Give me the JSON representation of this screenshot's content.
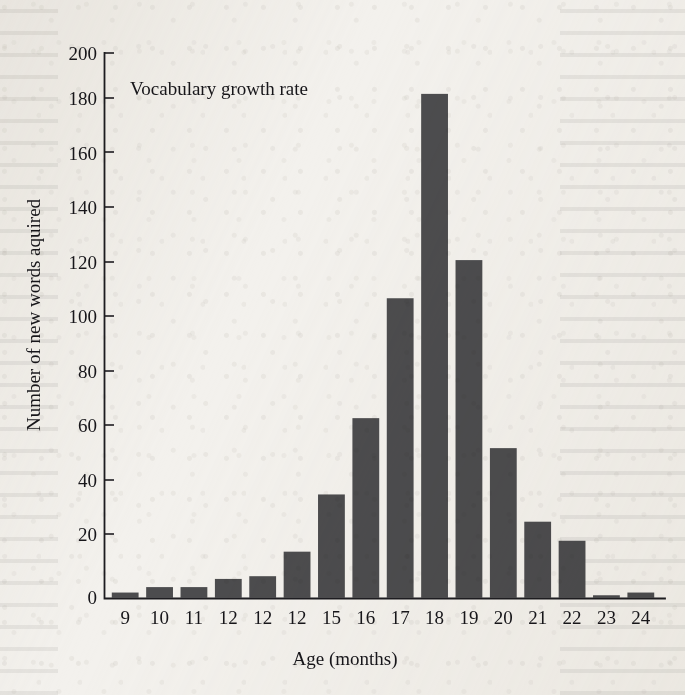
{
  "figure": {
    "background_color": "#f3f1ed",
    "ink_color": "#17161a",
    "bar_color": "#4c4c4e"
  },
  "chart_data": {
    "type": "bar",
    "title": "Vocabulary growth rate",
    "xlabel": "Age (months)",
    "ylabel": "Number of new words aquired",
    "categories": [
      "9",
      "10",
      "11",
      "12",
      "12",
      "12",
      "15",
      "16",
      "17",
      "18",
      "19",
      "20",
      "21",
      "22",
      "23",
      "24"
    ],
    "values": [
      2,
      4,
      4,
      7,
      8,
      17,
      38,
      66,
      110,
      185,
      124,
      55,
      28,
      21,
      1,
      2
    ],
    "series": [
      {
        "name": "Number of new words aquired",
        "values": [
          2,
          4,
          4,
          7,
          8,
          17,
          38,
          66,
          110,
          185,
          124,
          55,
          28,
          21,
          1,
          2
        ]
      }
    ],
    "ylim": [
      0,
      200
    ],
    "ytick_labels": [
      "0",
      "20",
      "40",
      "60",
      "80",
      "100",
      "120",
      "140",
      "160",
      "180",
      "200"
    ],
    "ytick_values": [
      0,
      20,
      40,
      60,
      80,
      100,
      120,
      140,
      160,
      180,
      200
    ],
    "xtick_labels": [
      "9",
      "10",
      "11",
      "12",
      "12",
      "12",
      "15",
      "16",
      "17",
      "18",
      "19",
      "20",
      "21",
      "22",
      "23",
      "24"
    ],
    "grid": false,
    "legend": null,
    "legend_position": "none",
    "annotations": [
      {
        "text": "Vocabulary growth rate",
        "x_category": "11",
        "y_value": 190
      }
    ]
  }
}
